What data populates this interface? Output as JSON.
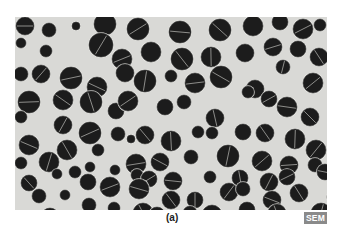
{
  "figure": {
    "panel_label": "(a)",
    "badge": "SEM",
    "colors": {
      "background": "#d9d9d6",
      "cell": "#1c1c1c",
      "cell_rim": "#e8e8e4",
      "badge_bg": "#8a8a8a"
    },
    "cells": [
      [
        10,
        9,
        9,
        1
      ],
      [
        34,
        13,
        7,
        0
      ],
      [
        61,
        9,
        4,
        0
      ],
      [
        90,
        7,
        11,
        0
      ],
      [
        123,
        12,
        11,
        1
      ],
      [
        165,
        15,
        11,
        1
      ],
      [
        205,
        13,
        11,
        1
      ],
      [
        238,
        9,
        10,
        0
      ],
      [
        265,
        5,
        8,
        0
      ],
      [
        288,
        12,
        10,
        1
      ],
      [
        305,
        8,
        6,
        0
      ],
      [
        6,
        26,
        5,
        0
      ],
      [
        31,
        34,
        6,
        0
      ],
      [
        86,
        28,
        12,
        1
      ],
      [
        107,
        42,
        10,
        1
      ],
      [
        136,
        35,
        10,
        0
      ],
      [
        167,
        42,
        11,
        1
      ],
      [
        196,
        40,
        10,
        1
      ],
      [
        230,
        36,
        9,
        0
      ],
      [
        258,
        30,
        9,
        1
      ],
      [
        283,
        32,
        8,
        0
      ],
      [
        304,
        40,
        9,
        1
      ],
      [
        6,
        57,
        7,
        0
      ],
      [
        26,
        57,
        9,
        1
      ],
      [
        56,
        61,
        11,
        1
      ],
      [
        82,
        70,
        10,
        1
      ],
      [
        110,
        56,
        9,
        0
      ],
      [
        130,
        64,
        11,
        1
      ],
      [
        156,
        59,
        6,
        0
      ],
      [
        180,
        66,
        10,
        1
      ],
      [
        206,
        60,
        11,
        1
      ],
      [
        240,
        72,
        9,
        0
      ],
      [
        268,
        50,
        7,
        1
      ],
      [
        298,
        66,
        10,
        1
      ],
      [
        14,
        85,
        11,
        1
      ],
      [
        48,
        83,
        10,
        1
      ],
      [
        76,
        85,
        11,
        1
      ],
      [
        101,
        94,
        8,
        0
      ],
      [
        113,
        84,
        10,
        1
      ],
      [
        150,
        90,
        8,
        0
      ],
      [
        169,
        85,
        7,
        0
      ],
      [
        200,
        101,
        9,
        1
      ],
      [
        233,
        75,
        6,
        0
      ],
      [
        254,
        82,
        8,
        1
      ],
      [
        272,
        90,
        10,
        1
      ],
      [
        295,
        100,
        9,
        1
      ],
      [
        6,
        100,
        6,
        0
      ],
      [
        48,
        108,
        9,
        1
      ],
      [
        75,
        116,
        11,
        1
      ],
      [
        103,
        117,
        7,
        0
      ],
      [
        130,
        118,
        9,
        1
      ],
      [
        156,
        124,
        10,
        1
      ],
      [
        183,
        115,
        6,
        0
      ],
      [
        197,
        116,
        6,
        0
      ],
      [
        228,
        115,
        8,
        0
      ],
      [
        250,
        116,
        9,
        1
      ],
      [
        280,
        122,
        10,
        1
      ],
      [
        301,
        133,
        10,
        1
      ],
      [
        320,
        120,
        5,
        0
      ],
      [
        14,
        128,
        10,
        1
      ],
      [
        52,
        133,
        10,
        1
      ],
      [
        83,
        133,
        6,
        0
      ],
      [
        116,
        122,
        4,
        0
      ],
      [
        121,
        147,
        10,
        1
      ],
      [
        145,
        145,
        9,
        1
      ],
      [
        176,
        140,
        7,
        0
      ],
      [
        213,
        139,
        11,
        1
      ],
      [
        247,
        144,
        10,
        1
      ],
      [
        274,
        148,
        9,
        1
      ],
      [
        300,
        148,
        7,
        0
      ],
      [
        6,
        146,
        6,
        0
      ],
      [
        34,
        145,
        10,
        1
      ],
      [
        42,
        157,
        5,
        0
      ],
      [
        60,
        155,
        6,
        0
      ],
      [
        75,
        150,
        5,
        0
      ],
      [
        100,
        153,
        5,
        0
      ],
      [
        122,
        158,
        6,
        0
      ],
      [
        134,
        162,
        8,
        1
      ],
      [
        158,
        164,
        9,
        1
      ],
      [
        195,
        160,
        6,
        0
      ],
      [
        225,
        161,
        8,
        1
      ],
      [
        254,
        165,
        9,
        1
      ],
      [
        272,
        160,
        8,
        1
      ],
      [
        310,
        155,
        8,
        1
      ],
      [
        14,
        166,
        8,
        1
      ],
      [
        24,
        179,
        7,
        0
      ],
      [
        73,
        165,
        8,
        0
      ],
      [
        95,
        170,
        10,
        1
      ],
      [
        124,
        172,
        10,
        1
      ],
      [
        156,
        183,
        9,
        1
      ],
      [
        180,
        183,
        8,
        1
      ],
      [
        214,
        175,
        9,
        1
      ],
      [
        228,
        172,
        7,
        0
      ],
      [
        257,
        183,
        9,
        1
      ],
      [
        284,
        176,
        9,
        1
      ],
      [
        318,
        180,
        6,
        0
      ],
      [
        50,
        178,
        5,
        0
      ],
      [
        74,
        188,
        7,
        0
      ],
      [
        99,
        191,
        6,
        0
      ],
      [
        128,
        196,
        10,
        1
      ],
      [
        142,
        198,
        8,
        0
      ],
      [
        175,
        196,
        7,
        0
      ],
      [
        197,
        198,
        10,
        1
      ],
      [
        232,
        193,
        8,
        0
      ],
      [
        262,
        196,
        9,
        1
      ],
      [
        306,
        196,
        10,
        1
      ],
      [
        35,
        200,
        9,
        1
      ]
    ]
  }
}
